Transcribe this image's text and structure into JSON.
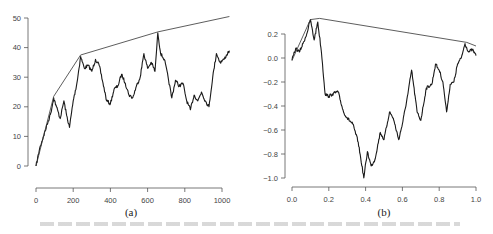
{
  "chart_data": [
    {
      "panel": "(a)",
      "type": "line",
      "title": "",
      "xlabel": "",
      "ylabel": "",
      "xlim": [
        0,
        1050
      ],
      "ylim": [
        0,
        50
      ],
      "xticks": [
        0,
        200,
        400,
        600,
        800,
        1000
      ],
      "yticks": [
        0,
        10,
        20,
        30,
        40,
        50
      ],
      "grid": false,
      "series": [
        {
          "name": "random walk",
          "x": [
            0,
            20,
            40,
            60,
            80,
            95,
            110,
            130,
            150,
            165,
            180,
            200,
            220,
            240,
            260,
            280,
            300,
            320,
            340,
            360,
            380,
            400,
            420,
            440,
            460,
            480,
            500,
            520,
            540,
            560,
            580,
            600,
            620,
            640,
            655,
            670,
            690,
            710,
            730,
            750,
            770,
            790,
            810,
            830,
            850,
            870,
            890,
            910,
            930,
            950,
            970,
            990,
            1010,
            1040
          ],
          "values": [
            0,
            6,
            10,
            14,
            18,
            23,
            20,
            16,
            22,
            17,
            13,
            22,
            28,
            37,
            33,
            34,
            32,
            36,
            34,
            28,
            22,
            21,
            26,
            27,
            31,
            28,
            24,
            23,
            27,
            30,
            38,
            33,
            35,
            32,
            45,
            38,
            36,
            30,
            23,
            29,
            27,
            28,
            22,
            19,
            24,
            22,
            25,
            22,
            20,
            30,
            38,
            35,
            36,
            39
          ]
        },
        {
          "name": "concave majorant",
          "x": [
            0,
            95,
            240,
            655,
            1040
          ],
          "values": [
            0,
            23.5,
            37.5,
            45.3,
            50.5
          ]
        }
      ]
    },
    {
      "panel": "(b)",
      "type": "line",
      "title": "",
      "xlabel": "",
      "ylabel": "",
      "xlim": [
        0,
        1
      ],
      "ylim": [
        -1.0,
        0.3
      ],
      "xticks": [
        0.0,
        0.2,
        0.4,
        0.6,
        0.8,
        1.0
      ],
      "yticks": [
        -1.0,
        -0.8,
        -0.6,
        -0.4,
        -0.2,
        0.0,
        0.2
      ],
      "grid": false,
      "series": [
        {
          "name": "random walk",
          "x": [
            0,
            0.02,
            0.04,
            0.06,
            0.08,
            0.1,
            0.12,
            0.14,
            0.16,
            0.18,
            0.2,
            0.22,
            0.25,
            0.28,
            0.3,
            0.33,
            0.36,
            0.39,
            0.41,
            0.43,
            0.45,
            0.48,
            0.5,
            0.53,
            0.55,
            0.58,
            0.6,
            0.63,
            0.65,
            0.68,
            0.7,
            0.73,
            0.76,
            0.78,
            0.8,
            0.82,
            0.84,
            0.86,
            0.88,
            0.9,
            0.92,
            0.94,
            0.96,
            0.98,
            1.0
          ],
          "values": [
            -0.02,
            0.08,
            0.05,
            0.12,
            0.2,
            0.32,
            0.15,
            0.3,
            0.05,
            -0.3,
            -0.32,
            -0.3,
            -0.28,
            -0.45,
            -0.5,
            -0.55,
            -0.7,
            -1.0,
            -0.78,
            -0.9,
            -0.85,
            -0.62,
            -0.68,
            -0.45,
            -0.5,
            -0.68,
            -0.55,
            -0.3,
            -0.1,
            -0.45,
            -0.52,
            -0.25,
            -0.22,
            -0.05,
            -0.1,
            -0.2,
            -0.45,
            -0.22,
            -0.2,
            -0.05,
            0.0,
            0.12,
            0.05,
            0.07,
            0.02
          ]
        },
        {
          "name": "concave majorant",
          "x": [
            0,
            0.1,
            0.15,
            0.95,
            1.0
          ],
          "values": [
            -0.02,
            0.32,
            0.33,
            0.13,
            0.1
          ]
        }
      ]
    }
  ]
}
